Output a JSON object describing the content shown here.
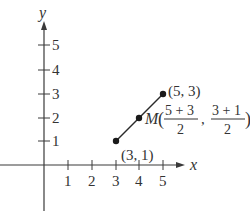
{
  "diagram": {
    "type": "coordinate-plane",
    "x_axis_label": "x",
    "y_axis_label": "y",
    "x_ticks": [
      "1",
      "2",
      "3",
      "4",
      "5"
    ],
    "y_ticks": [
      "1",
      "2",
      "3",
      "4",
      "5"
    ],
    "points": [
      {
        "name": "endpoint-a",
        "label": "(3, 1)",
        "x": 3,
        "y": 1
      },
      {
        "name": "endpoint-b",
        "label": "(5, 3)",
        "x": 5,
        "y": 3
      },
      {
        "name": "midpoint",
        "label": "M",
        "x": 4,
        "y": 2
      }
    ],
    "midpoint_formula": {
      "name": "M",
      "open_paren": "(",
      "x_numerator": "5 + 3",
      "x_denominator": "2",
      "separator": ",",
      "y_numerator": "3 + 1",
      "y_denominator": "2",
      "close_paren": ")"
    }
  }
}
